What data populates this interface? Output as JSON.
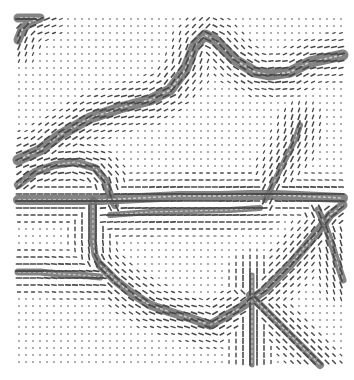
{
  "figure": {
    "type": "orientation-vector-field",
    "background": "#ffffff",
    "dot_color": "#8a8a8a",
    "dash_color": "#4a4a4a",
    "band_color": "#6e6e6e",
    "grid": {
      "x0": 19,
      "y0": 19,
      "x1": 343,
      "y1": 365,
      "step": 7
    },
    "bands": [
      {
        "name": "top-left-corner",
        "width": 9,
        "points": [
          [
            18,
            40
          ],
          [
            22,
            30
          ],
          [
            30,
            22
          ],
          [
            40,
            18
          ],
          [
            18,
            18
          ]
        ]
      },
      {
        "name": "upper-main-diagonal",
        "width": 11,
        "points": [
          [
            18,
            160
          ],
          [
            40,
            150
          ],
          [
            60,
            135
          ],
          [
            90,
            118
          ],
          [
            120,
            108
          ],
          [
            150,
            100
          ],
          [
            170,
            90
          ],
          [
            185,
            70
          ],
          [
            195,
            45
          ],
          [
            205,
            35
          ],
          [
            215,
            40
          ],
          [
            235,
            60
          ],
          [
            255,
            72
          ],
          [
            270,
            75
          ],
          [
            290,
            72
          ],
          [
            310,
            62
          ],
          [
            343,
            55
          ]
        ]
      },
      {
        "name": "left-bulge-top",
        "width": 8,
        "points": [
          [
            18,
            185
          ],
          [
            35,
            172
          ],
          [
            55,
            165
          ],
          [
            75,
            162
          ],
          [
            95,
            168
          ],
          [
            105,
            180
          ],
          [
            110,
            195
          ],
          [
            115,
            205
          ]
        ]
      },
      {
        "name": "middle-horizontal",
        "width": 10,
        "points": [
          [
            18,
            200
          ],
          [
            60,
            200
          ],
          [
            100,
            200
          ],
          [
            140,
            198
          ],
          [
            180,
            196
          ],
          [
            220,
            196
          ],
          [
            250,
            195
          ],
          [
            275,
            195
          ],
          [
            300,
            196
          ],
          [
            320,
            197
          ],
          [
            343,
            198
          ]
        ]
      },
      {
        "name": "spike-up",
        "width": 6,
        "points": [
          [
            265,
            200
          ],
          [
            275,
            180
          ],
          [
            285,
            160
          ],
          [
            295,
            140
          ],
          [
            300,
            125
          ]
        ]
      },
      {
        "name": "left-vertical",
        "width": 7,
        "points": [
          [
            93,
            200
          ],
          [
            93,
            220
          ],
          [
            93,
            240
          ],
          [
            95,
            255
          ],
          [
            100,
            265
          ]
        ]
      },
      {
        "name": "left-diagonal-down",
        "width": 9,
        "points": [
          [
            100,
            265
          ],
          [
            115,
            280
          ],
          [
            130,
            292
          ],
          [
            150,
            305
          ],
          [
            170,
            312
          ],
          [
            190,
            318
          ],
          [
            210,
            325
          ]
        ]
      },
      {
        "name": "left-horizontal-lower",
        "width": 7,
        "points": [
          [
            18,
            272
          ],
          [
            40,
            272
          ],
          [
            60,
            274
          ],
          [
            80,
            275
          ],
          [
            100,
            277
          ]
        ]
      },
      {
        "name": "lower-right-curve",
        "width": 9,
        "points": [
          [
            210,
            325
          ],
          [
            240,
            308
          ],
          [
            265,
            290
          ],
          [
            290,
            265
          ],
          [
            315,
            235
          ],
          [
            330,
            215
          ],
          [
            343,
            205
          ]
        ]
      },
      {
        "name": "right-diagonal-down",
        "width": 8,
        "points": [
          [
            250,
            295
          ],
          [
            265,
            310
          ],
          [
            285,
            330
          ],
          [
            305,
            350
          ],
          [
            320,
            365
          ]
        ]
      },
      {
        "name": "lower-vertical",
        "width": 5,
        "points": [
          [
            252,
            275
          ],
          [
            252,
            300
          ],
          [
            252,
            330
          ],
          [
            252,
            365
          ]
        ]
      },
      {
        "name": "right-fan",
        "width": 7,
        "points": [
          [
            318,
            210
          ],
          [
            325,
            225
          ],
          [
            332,
            245
          ],
          [
            338,
            265
          ],
          [
            343,
            280
          ]
        ]
      },
      {
        "name": "middle-upper-stripe",
        "width": 6,
        "points": [
          [
            110,
            215
          ],
          [
            150,
            212
          ],
          [
            190,
            211
          ],
          [
            230,
            210
          ],
          [
            260,
            208
          ]
        ]
      }
    ],
    "dash_influence_radius": 26
  }
}
